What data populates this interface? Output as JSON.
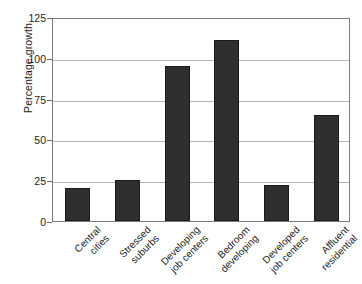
{
  "chart_data": {
    "type": "bar",
    "title": "",
    "subtitle": "",
    "xlabel": "",
    "ylabel": "Percentage growth",
    "ylim": [
      0,
      125
    ],
    "yticks": [
      0,
      25,
      50,
      75,
      100,
      125
    ],
    "ytick_labels": [
      "0",
      "25",
      "50",
      "75",
      "100",
      "125"
    ],
    "grid": true,
    "legend": false,
    "bar_color": "#2f2f2f",
    "gridline_color": "#b4b4b4",
    "axis_color": "#7a7a7a",
    "categories": [
      "Central cities",
      "Stressed suburbs",
      "Developing job centers",
      "Bedroom developing",
      "Developed job centers",
      "Affluent residential"
    ],
    "category_lines": [
      [
        "Central",
        "cities"
      ],
      [
        "Stressed",
        "suburbs"
      ],
      [
        "Developing",
        "job centers"
      ],
      [
        "Bedroom",
        "developing"
      ],
      [
        "Developed",
        "job centers"
      ],
      [
        "Affluent",
        "residential"
      ]
    ],
    "values": [
      20,
      25,
      95,
      111,
      22,
      65
    ]
  }
}
